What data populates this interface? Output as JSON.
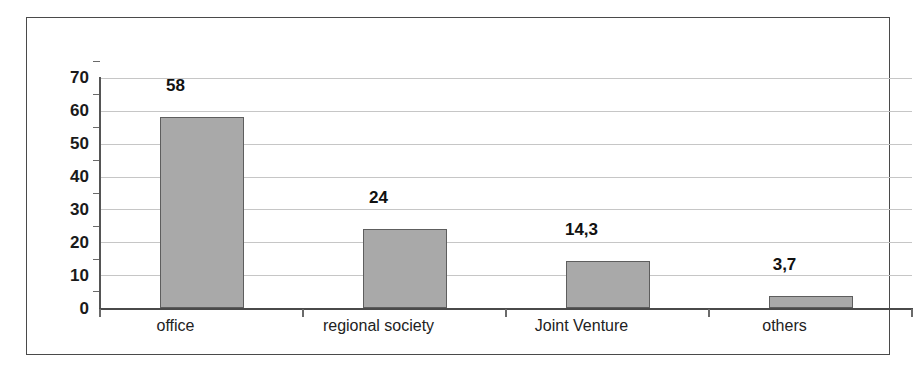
{
  "chart_data": {
    "type": "bar",
    "title": "",
    "xlabel": "",
    "ylabel": "",
    "categories": [
      "office",
      "regional society",
      "Joint Venture",
      "others"
    ],
    "values": [
      58,
      24,
      14.3,
      3.7
    ],
    "value_labels": [
      "58",
      "24",
      "14,3",
      "3,7"
    ],
    "ylim": [
      0,
      70
    ],
    "ytick_labels": [
      "0",
      "10",
      "20",
      "30",
      "40",
      "50",
      "60",
      "70"
    ],
    "ytick_values": [
      0,
      10,
      20,
      30,
      40,
      50,
      60,
      70
    ],
    "grid": true,
    "legend": "none",
    "decimal_separator": ",",
    "colors": {
      "bar_fill": "#a9a9a9",
      "bar_border": "#5e5e5e",
      "gridline": "#c6c6c6",
      "axis": "#4a4a4a",
      "frame": "#4a4a4a",
      "text": "#1a1a1a",
      "background": "#ffffff"
    }
  }
}
